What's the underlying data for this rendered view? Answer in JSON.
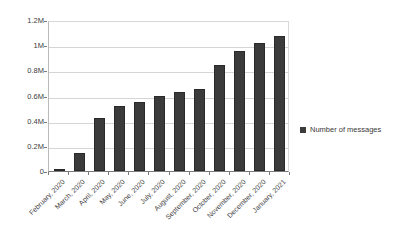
{
  "chart_data": {
    "type": "bar",
    "title": "",
    "subtitle": "",
    "xlabel": "",
    "ylabel": "",
    "grid": true,
    "legend_position": "right",
    "ylim": [
      0,
      1200000
    ],
    "ytick_labels": [
      "1.2M",
      "1M",
      "0.8M",
      "0.6M",
      "0.4M",
      "0.2M",
      "0"
    ],
    "ytick_values": [
      1200000,
      1000000,
      800000,
      600000,
      400000,
      200000,
      0
    ],
    "categories": [
      "February, 2020",
      "March, 2020",
      "April, 2020",
      "May, 2020",
      "June, 2020",
      "July, 2020",
      "August, 2020",
      "September, 2020",
      "October, 2020",
      "November, 2020",
      "December, 2020",
      "January, 2021"
    ],
    "series": [
      {
        "name": "Number of messages",
        "color": "#3b3b3b",
        "values": [
          5000,
          143000,
          420000,
          515000,
          550000,
          595000,
          630000,
          655000,
          840000,
          950000,
          1020000,
          1075000
        ]
      }
    ]
  },
  "legend": {
    "entries": [
      {
        "label": "Number of messages",
        "marker": "square-marker",
        "color": "#3b3b3b"
      }
    ]
  },
  "colors": {
    "bar": "#3b3b3b",
    "gridline": "#d5d5d5",
    "axis": "#7a7a7a",
    "background": "#ffffff",
    "text": "#3a3a3a"
  }
}
